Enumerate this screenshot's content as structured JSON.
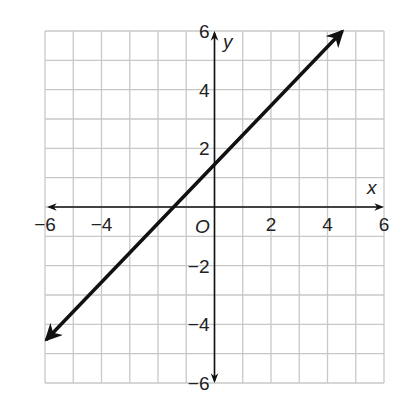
{
  "chart_data": {
    "type": "line",
    "title": "",
    "xlabel": "x",
    "ylabel": "y",
    "origin_label": "O",
    "xlim": [
      -6,
      6
    ],
    "ylim": [
      -6,
      6
    ],
    "grid": true,
    "grid_step": 1,
    "x_ticks": [
      -6,
      -4,
      2,
      4,
      6
    ],
    "x_tick_labels": [
      "−6",
      "−4",
      "2",
      "4",
      "6"
    ],
    "y_ticks": [
      6,
      4,
      2,
      -2,
      -4,
      -6
    ],
    "y_tick_labels": [
      "6",
      "4",
      "2",
      "−2",
      "−4",
      "−6"
    ],
    "series": [
      {
        "name": "line",
        "equation": "y = x + 1.5",
        "slope": 1,
        "y_intercept": 1.5,
        "x_intercept": -1.5,
        "x": [
          -6,
          4.5
        ],
        "y": [
          -4.5,
          6
        ],
        "arrows": "both",
        "color": "#111111"
      }
    ],
    "legend": null
  },
  "colors": {
    "grid": "#c8c8c8",
    "axis": "#111111",
    "line": "#111111",
    "text": "#222222"
  }
}
